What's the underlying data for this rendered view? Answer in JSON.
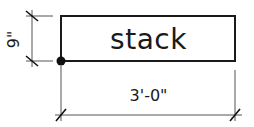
{
  "diagram": {
    "element_label": "stack",
    "width_dimension": "3'-0\"",
    "height_dimension": "9\"",
    "colors": {
      "stroke": "#1a1a1a",
      "dimension_line": "#555555",
      "background": "#ffffff"
    }
  }
}
